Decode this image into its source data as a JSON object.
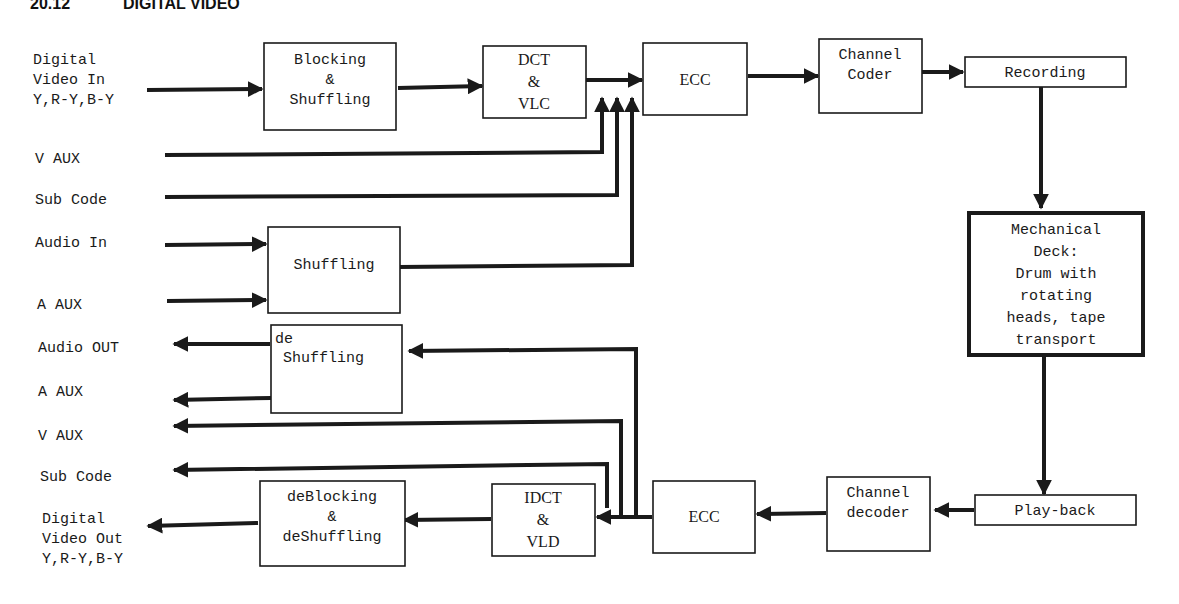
{
  "header": {
    "section_number": "20.12",
    "section_title": "DIGITAL VIDEO"
  },
  "diagram": {
    "colors": {
      "ink": "#1a1a1a",
      "background": "#ffffff"
    },
    "inputs": {
      "video_in": [
        "Digital",
        "Video In",
        "Y,R-Y,B-Y"
      ],
      "v_aux": "V AUX",
      "sub_code": "Sub Code",
      "audio_in": "Audio In",
      "a_aux": "A AUX"
    },
    "outputs": {
      "audio_out": "Audio OUT",
      "a_aux": "A AUX",
      "v_aux": "V AUX",
      "sub_code": "Sub Code",
      "video_out": [
        "Digital",
        "Video Out",
        "Y,R-Y,B-Y"
      ]
    },
    "blocks": {
      "blocking_shuffling": [
        "Blocking",
        "&",
        "Shuffling"
      ],
      "dct_vlc": [
        "DCT",
        "&",
        "VLC"
      ],
      "ecc_record": "ECC",
      "channel_coder": [
        "Channel",
        "Coder"
      ],
      "recording": "Recording",
      "mechanical_deck": [
        "Mechanical",
        "Deck:",
        "Drum with",
        "rotating",
        "heads, tape",
        "transport"
      ],
      "audio_shuffling": "Shuffling",
      "audio_deshuffling": [
        "de",
        "Shuffling"
      ],
      "playback": "Play-back",
      "channel_decoder": [
        "Channel",
        "decoder"
      ],
      "ecc_playback": "ECC",
      "idct_vld": [
        "IDCT",
        "&",
        "VLD"
      ],
      "deblocking_deshuffling": [
        "deBlocking",
        "&",
        "deShuffling"
      ]
    }
  }
}
